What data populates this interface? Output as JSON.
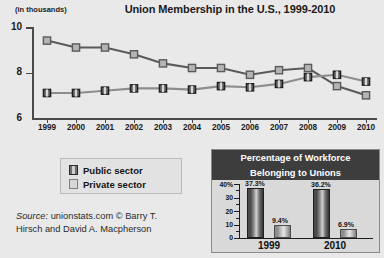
{
  "chart_data": [
    {
      "type": "line",
      "title": "Union Membership in the U.S., 1999-2010",
      "ylabel": "(in thousands)",
      "xlabel": "",
      "ylim": [
        6,
        10
      ],
      "yticks": [
        6,
        8,
        10
      ],
      "grid": false,
      "legend_position": "below-left",
      "categories": [
        "1999",
        "2000",
        "2001",
        "2002",
        "2003",
        "2004",
        "2005",
        "2006",
        "2007",
        "2008",
        "2009",
        "2010"
      ],
      "series": [
        {
          "name": "Private sector",
          "values": [
            9.4,
            9.1,
            9.1,
            8.8,
            8.4,
            8.2,
            8.2,
            7.9,
            8.1,
            8.2,
            7.4,
            7.0
          ]
        },
        {
          "name": "Public sector",
          "values": [
            7.1,
            7.1,
            7.2,
            7.3,
            7.3,
            7.25,
            7.4,
            7.35,
            7.5,
            7.8,
            7.9,
            7.6
          ]
        }
      ],
      "source": {
        "prefix": "Source:",
        "body": "unionstats.com © Barry T. Hirsch and David A. Macpherson"
      }
    },
    {
      "type": "bar",
      "title_line1": "Percentage of Workforce",
      "title_line2": "Belonging to Unions",
      "categories": [
        "1999",
        "2010"
      ],
      "ylim": [
        0,
        40
      ],
      "yticks": [
        0,
        10,
        20,
        30,
        40
      ],
      "ytick_labels": [
        "0",
        "10",
        "20",
        "30",
        "40%"
      ],
      "series": [
        {
          "name": "Public sector",
          "values": [
            37.3,
            36.2
          ],
          "labels": [
            "37.3%",
            "36.2%"
          ]
        },
        {
          "name": "Private sector",
          "values": [
            9.4,
            6.9
          ],
          "labels": [
            "9.4%",
            "6.9%"
          ]
        }
      ]
    }
  ],
  "chart": {
    "title": "Union Membership in the U.S., 1999-2010",
    "y_unit": "(in thousands)",
    "y_labels": [
      "10",
      "8",
      "6"
    ],
    "x_labels": [
      "1999",
      "2000",
      "2001",
      "2002",
      "2003",
      "2004",
      "2005",
      "2006",
      "2007",
      "2008",
      "2009",
      "2010"
    ]
  },
  "legend": {
    "items": [
      {
        "label": "Public sector"
      },
      {
        "label": "Private sector"
      }
    ]
  },
  "source": {
    "prefix": "Source:",
    "line1": " unionstats.com © Barry T.",
    "line2": "Hirsch and David A. Macpherson"
  },
  "inset": {
    "title_line1": "Percentage of Workforce",
    "title_line2": "Belonging to Unions",
    "y_labels": [
      "40%",
      "30",
      "20",
      "10",
      "0"
    ],
    "x_labels": [
      "1999",
      "2010"
    ],
    "bar_labels": [
      "37.3%",
      "9.4%",
      "36.2%",
      "6.9%"
    ]
  },
  "colors": {
    "background": "#e9e9e9",
    "axis": "#4a4a4a",
    "private_line": "#5a5a5a",
    "public_line": "#8d8d8d",
    "inset_header_bg": "#3d3d3d",
    "inset_header_text": "#ffffff"
  }
}
